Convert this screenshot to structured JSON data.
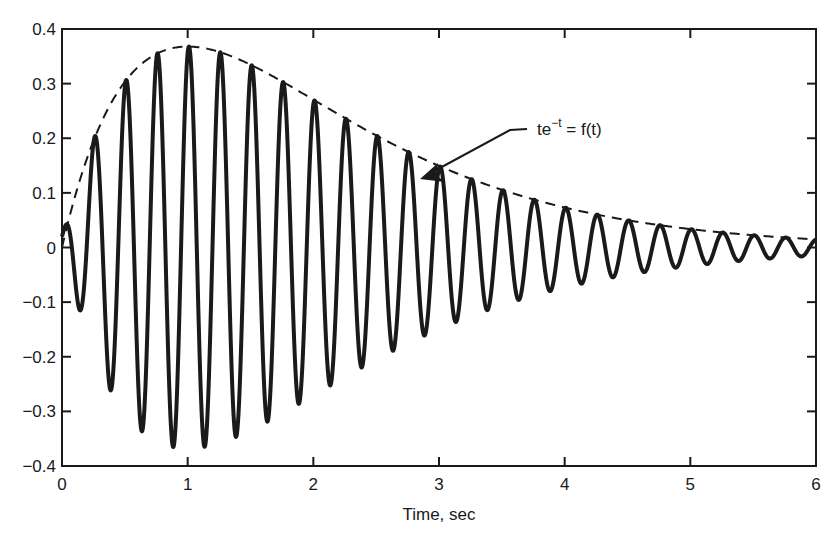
{
  "chart_data": {
    "type": "line",
    "title": "",
    "xlabel": "Time, sec",
    "ylabel": "",
    "xlim": [
      0,
      6
    ],
    "ylim": [
      -0.4,
      0.4
    ],
    "grid": false,
    "legend": null,
    "x_ticks": [
      0,
      1,
      2,
      3,
      4,
      5,
      6
    ],
    "x_tick_labels": [
      "0",
      "1",
      "2",
      "3",
      "4",
      "5",
      "6"
    ],
    "y_ticks": [
      0.4,
      0.3,
      0.2,
      0.1,
      0,
      -0.1,
      -0.2,
      -0.3,
      -0.4
    ],
    "y_tick_labels": [
      "0.4",
      "0.3",
      "0.2",
      "0.1",
      "0",
      "−0.1",
      "−0.2",
      "−0.3",
      "−0.4"
    ],
    "series": [
      {
        "name": "oscillation",
        "style": "solid-thick",
        "description": "t*e^(-t) modulated oscillation, period approx 0.25 s",
        "formula": "t*exp(-t)*sin(2*pi*4*t + 0.0)",
        "frequency_hz": 4,
        "peak_points": {
          "x": [
            0.26,
            0.51,
            0.76,
            1.01,
            1.26,
            1.51,
            1.76,
            2.01,
            2.26,
            2.51,
            2.76,
            3.01,
            3.26,
            3.51,
            3.76,
            4.01,
            4.26,
            4.51,
            4.76,
            5.01,
            5.26,
            5.51,
            5.76
          ],
          "y": [
            0.18,
            0.29,
            0.35,
            0.36,
            0.36,
            0.33,
            0.3,
            0.27,
            0.24,
            0.2,
            0.18,
            0.15,
            0.13,
            0.1,
            0.09,
            0.07,
            0.06,
            0.05,
            0.04,
            0.03,
            0.03,
            0.02,
            0.02
          ]
        },
        "trough_points": {
          "x": [
            0.13,
            0.38,
            0.63,
            0.88,
            1.13,
            1.38,
            1.63,
            1.88,
            2.13,
            2.38,
            2.63,
            2.88,
            3.13,
            3.38,
            3.63,
            3.88,
            4.13,
            4.38,
            4.63,
            4.88,
            5.13,
            5.38,
            5.63,
            5.88
          ],
          "y": [
            -0.1,
            -0.25,
            -0.33,
            -0.36,
            -0.36,
            -0.34,
            -0.31,
            -0.28,
            -0.25,
            -0.22,
            -0.18,
            -0.16,
            -0.13,
            -0.11,
            -0.09,
            -0.08,
            -0.07,
            -0.05,
            -0.04,
            -0.04,
            -0.03,
            -0.02,
            -0.02,
            -0.01
          ]
        }
      },
      {
        "name": "te^-t = f(t)",
        "style": "dashed",
        "formula": "t*exp(-t)",
        "x": [
          0,
          0.5,
          1,
          1.5,
          2,
          2.5,
          3,
          3.5,
          4,
          4.5,
          5,
          5.5,
          6
        ],
        "y": [
          0,
          0.3,
          0.37,
          0.33,
          0.27,
          0.21,
          0.15,
          0.11,
          0.07,
          0.05,
          0.03,
          0.02,
          0.01
        ]
      }
    ],
    "annotations": [
      {
        "text_main": "te",
        "text_sup": "−t",
        "text_rest": " = f(t)",
        "arrow_to": [
          2.75,
          0.16
        ],
        "text_at": [
          3.5,
          0.21
        ]
      }
    ]
  },
  "colors": {
    "line": "#1a1a1a",
    "background": "#ffffff"
  }
}
